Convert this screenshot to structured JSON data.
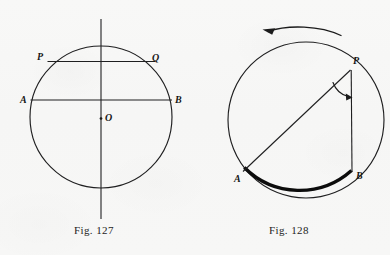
{
  "page": {
    "background_color": "#f7f7f6",
    "ink_color": "#1d1d1d",
    "width": 390,
    "height": 255
  },
  "figures": [
    {
      "id": "fig-127",
      "caption": "Fig. 127",
      "kind": "circle-with-chords",
      "circle": {
        "cx": 101,
        "cy": 117,
        "r": 71
      },
      "labels": {
        "P": "P",
        "Q": "Q",
        "A": "A",
        "B": "B",
        "O": "O"
      },
      "points": {
        "P": {
          "x": 46,
          "y": 62
        },
        "Q": {
          "x": 156,
          "y": 62
        },
        "A": {
          "x": 30,
          "y": 100
        },
        "B": {
          "x": 172,
          "y": 100
        },
        "O": {
          "x": 101,
          "y": 117
        }
      },
      "chords": [
        {
          "name": "chord-PQ",
          "from": "P",
          "to": "Q"
        },
        {
          "name": "chord-AB",
          "from": "A",
          "to": "B"
        }
      ],
      "vertical_axis": {
        "x": 101,
        "y1": 19,
        "y2": 219
      },
      "center_dot": {
        "x": 101,
        "y": 118,
        "r": 1.3
      }
    },
    {
      "id": "fig-128",
      "caption": "Fig. 128",
      "kind": "inscribed-angle-with-rotation-arrow",
      "circle": {
        "cx": 306,
        "cy": 120,
        "r": 78
      },
      "labels": {
        "P": "P",
        "A": "A",
        "B": "B"
      },
      "points": {
        "P": {
          "x": 350,
          "y": 56
        },
        "A": {
          "x": 243,
          "y": 172
        },
        "B": {
          "x": 352,
          "y": 172
        }
      },
      "segments": [
        {
          "name": "chord-PA",
          "from": "P",
          "to": "A"
        },
        {
          "name": "chord-PB",
          "from": "P",
          "to": "B"
        }
      ],
      "angle_arc": {
        "at": "P",
        "has_arrowhead": true
      },
      "highlighted_arc": {
        "name": "arc-AB",
        "from": "A",
        "to": "B",
        "style": "thick"
      },
      "rotation_arrow": {
        "name": "rotation-arrow",
        "direction": "counterclockwise",
        "head": "left"
      }
    }
  ]
}
